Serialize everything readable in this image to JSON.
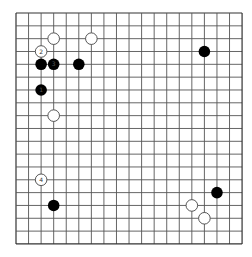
{
  "board": {
    "size": 19,
    "origin_x": 16,
    "origin_y": 13,
    "spacing_x": 12.56,
    "spacing_y": 12.83,
    "stone_radius": 5.8,
    "line_color": "#555555",
    "edge_color": "#333333",
    "background": "#ffffff",
    "black_color": "#000000",
    "white_fill": "#ffffff",
    "white_stroke": "#444444"
  },
  "stones": [
    {
      "color": "white",
      "col": 3,
      "row": 2,
      "label": ""
    },
    {
      "color": "white",
      "col": 6,
      "row": 2,
      "label": ""
    },
    {
      "color": "white",
      "col": 2,
      "row": 3,
      "label": "2"
    },
    {
      "color": "black",
      "col": 2,
      "row": 4,
      "label": ""
    },
    {
      "color": "black",
      "col": 3,
      "row": 4,
      "label": "3"
    },
    {
      "color": "black",
      "col": 5,
      "row": 4,
      "label": ""
    },
    {
      "color": "black",
      "col": 2,
      "row": 6,
      "label": "1"
    },
    {
      "color": "white",
      "col": 3,
      "row": 8,
      "label": ""
    },
    {
      "color": "black",
      "col": 15,
      "row": 3,
      "label": ""
    },
    {
      "color": "white",
      "col": 2,
      "row": 13,
      "label": "4"
    },
    {
      "color": "black",
      "col": 3,
      "row": 15,
      "label": ""
    },
    {
      "color": "black",
      "col": 16,
      "row": 14,
      "label": ""
    },
    {
      "color": "white",
      "col": 14,
      "row": 15,
      "label": ""
    },
    {
      "color": "white",
      "col": 15,
      "row": 16,
      "label": ""
    }
  ]
}
